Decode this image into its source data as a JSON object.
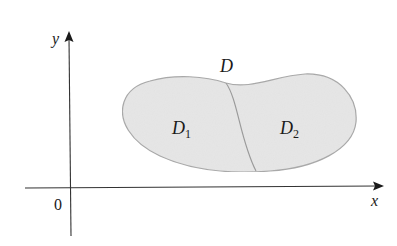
{
  "figure": {
    "type": "region-decomposition",
    "axes": {
      "x_label": "x",
      "y_label": "y",
      "origin_label": "0"
    },
    "region": {
      "label": "D",
      "fill_color": "#e6e6e6",
      "stroke_color": "#a8a8a8",
      "subregions": [
        {
          "label": "D",
          "subscript": "1"
        },
        {
          "label": "D",
          "subscript": "2"
        }
      ]
    },
    "colors": {
      "axis": "#333333",
      "text": "#1a1a1a"
    }
  }
}
